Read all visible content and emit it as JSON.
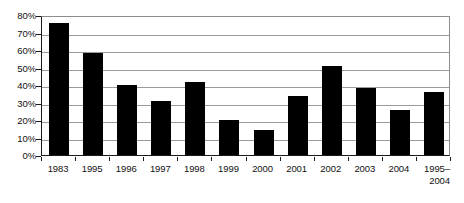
{
  "chart_data": {
    "type": "bar",
    "title": "",
    "subtitle": "",
    "xlabel": "",
    "ylabel": "",
    "categories": [
      "1983",
      "1995",
      "1996",
      "1997",
      "1998",
      "1999",
      "2000",
      "2001",
      "2002",
      "2003",
      "2004",
      "1995–\n2004"
    ],
    "values": [
      75.5,
      58.5,
      40,
      31,
      42,
      20,
      14.5,
      34,
      51,
      38.5,
      26,
      36
    ],
    "ylim": [
      0,
      80
    ],
    "ytick_values": [
      0,
      10,
      20,
      30,
      40,
      50,
      60,
      70,
      80
    ],
    "ytick_labels": [
      "0%",
      "10%",
      "20%",
      "30%",
      "40%",
      "50%",
      "60%",
      "70%",
      "80%"
    ],
    "grid": true,
    "legend": false,
    "legend_position": "none",
    "bar_color": "#000000",
    "grid_color": "#9a9a9a",
    "axis_color": "#1a1a1a",
    "background_color": "#ffffff"
  }
}
